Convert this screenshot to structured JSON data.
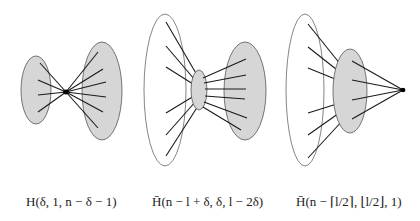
{
  "figure": {
    "graphs": [
      {
        "id": "graph-1",
        "caption": "H(δ, 1, n − δ − 1)",
        "parts": [
          "clique of size δ (left, shaded)",
          "single vertex (center)",
          "clique of size n − δ − 1 (right, shaded)"
        ]
      },
      {
        "id": "graph-2",
        "caption": "H̄(n − l + δ, δ, l − 2δ)",
        "parts": [
          "set of size n − l + δ (left, unshaded)",
          "clique of size δ (center, shaded)",
          "clique of size l − 2δ (right, shaded)"
        ]
      },
      {
        "id": "graph-3",
        "caption": "H̄(n − ⌈l/2⌉, ⌊l/2⌋, 1)",
        "parts": [
          "set of size n − ⌈l/2⌉ (left, unshaded)",
          "clique of size ⌊l/2⌋ (center, shaded)",
          "single vertex (right)"
        ]
      }
    ],
    "colors": {
      "shade": "#d6d6d6",
      "stroke": "#555555",
      "edge": "#1a1a1a",
      "background": "#ffffff"
    }
  }
}
